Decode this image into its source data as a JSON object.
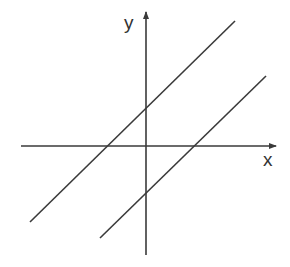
{
  "diagram": {
    "title": "",
    "colors": {
      "stroke": "#3a3a3a",
      "background": "#ffffff"
    },
    "axes": {
      "x": {
        "label": "x",
        "from": [
          21,
          146
        ],
        "to": [
          276,
          146
        ],
        "label_pos": [
          263,
          166
        ]
      },
      "y": {
        "label": "y",
        "from": [
          146,
          255
        ],
        "to": [
          146,
          12
        ],
        "label_pos": [
          124,
          29
        ]
      }
    },
    "lines": [
      {
        "name": "upper-line",
        "from": [
          30,
          222
        ],
        "to": [
          235,
          21
        ],
        "y_intercept_px": 109,
        "x_intercept_px": 106
      },
      {
        "name": "lower-line",
        "from": [
          100,
          238
        ],
        "to": [
          266,
          76
        ],
        "y_intercept_px": 193,
        "x_intercept_px": 195
      }
    ]
  }
}
